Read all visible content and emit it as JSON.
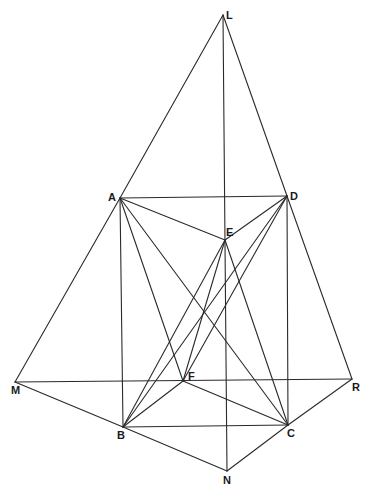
{
  "figure": {
    "type": "geometric-construction",
    "points": {
      "L": {
        "x": 223,
        "y": 15,
        "lx": 226,
        "ly": 19,
        "label": "L"
      },
      "A": {
        "x": 120,
        "y": 198,
        "lx": 108,
        "ly": 201,
        "label": "A"
      },
      "D": {
        "x": 287,
        "y": 196,
        "lx": 290,
        "ly": 200,
        "label": "D"
      },
      "E": {
        "x": 225,
        "y": 240,
        "lx": 226,
        "ly": 236,
        "label": "E"
      },
      "F": {
        "x": 183,
        "y": 381,
        "lx": 188,
        "ly": 380,
        "label": "F"
      },
      "M": {
        "x": 15,
        "y": 382,
        "lx": 11,
        "ly": 394,
        "label": "M"
      },
      "R": {
        "x": 352,
        "y": 379,
        "lx": 352,
        "ly": 391,
        "label": "R"
      },
      "B": {
        "x": 123,
        "y": 427,
        "lx": 117,
        "ly": 439,
        "label": "B"
      },
      "C": {
        "x": 288,
        "y": 425,
        "lx": 287,
        "ly": 437,
        "label": "C"
      },
      "N": {
        "x": 227,
        "y": 471,
        "lx": 223,
        "ly": 484,
        "label": "N"
      }
    },
    "segments": [
      [
        "L",
        "A"
      ],
      [
        "A",
        "M"
      ],
      [
        "L",
        "D"
      ],
      [
        "D",
        "R"
      ],
      [
        "L",
        "N"
      ],
      [
        "A",
        "D"
      ],
      [
        "A",
        "B"
      ],
      [
        "D",
        "C"
      ],
      [
        "M",
        "R"
      ],
      [
        "M",
        "B"
      ],
      [
        "B",
        "N"
      ],
      [
        "N",
        "C"
      ],
      [
        "C",
        "R"
      ],
      [
        "B",
        "C"
      ],
      [
        "A",
        "E"
      ],
      [
        "D",
        "E"
      ],
      [
        "A",
        "F"
      ],
      [
        "A",
        "C"
      ],
      [
        "E",
        "B"
      ],
      [
        "E",
        "F"
      ],
      [
        "E",
        "C"
      ],
      [
        "D",
        "B"
      ],
      [
        "D",
        "F"
      ],
      [
        "F",
        "B"
      ],
      [
        "F",
        "C"
      ]
    ]
  }
}
